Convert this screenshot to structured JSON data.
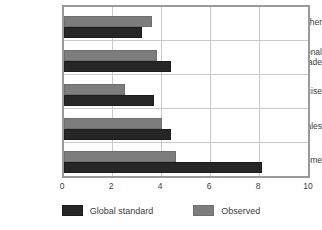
{
  "chart_data": {
    "type": "bar",
    "orientation": "horizontal",
    "title": "",
    "xlabel": "",
    "ylabel": "",
    "xlim": [
      0,
      10
    ],
    "xticks": [
      "0",
      "2",
      "4",
      "6",
      "8",
      "10"
    ],
    "grid": true,
    "legend_position": "bottom",
    "categories": [
      "Income",
      "Sales",
      "Excise",
      "International Trade",
      "Other"
    ],
    "series": [
      {
        "name": "Global standard",
        "color": "#262626",
        "values": [
          8.1,
          4.4,
          3.7,
          4.4,
          3.2
        ]
      },
      {
        "name": "Observed",
        "color": "#7d7d7d",
        "values": [
          4.6,
          4.0,
          2.5,
          3.8,
          3.6
        ]
      }
    ]
  },
  "category_labels": [
    {
      "line1": "Other",
      "line2": ""
    },
    {
      "line1": "International",
      "line2": "Trade"
    },
    {
      "line1": "Excise",
      "line2": ""
    },
    {
      "line1": "Sales",
      "line2": ""
    },
    {
      "line1": "Income",
      "line2": ""
    }
  ],
  "axis": {
    "tick0": "0",
    "tick1": "2",
    "tick2": "4",
    "tick3": "6",
    "tick4": "8",
    "tick5": "10"
  },
  "legend": {
    "global_label": "Global standard",
    "observed_label": "Observed"
  },
  "colors": {
    "global_standard": "#262626",
    "observed": "#7d7d7d",
    "frame": "#9a9a9a",
    "gridline": "#c9c9c9",
    "text": "#3d3d3d",
    "background": "#ffffff"
  }
}
